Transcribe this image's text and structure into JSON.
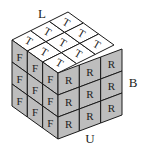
{
  "diagram": {
    "outer_labels": {
      "left_top": "L",
      "right": "B",
      "bottom": "U"
    },
    "faces": {
      "top": {
        "letter": "T",
        "rows": 3,
        "cols": 3,
        "color": "#ffffff"
      },
      "front": {
        "letter": "F",
        "rows": 3,
        "cols": 3,
        "color": "#bdbdbd"
      },
      "right": {
        "letter": "R",
        "rows": 3,
        "cols": 3,
        "color": "#bdbdbd"
      }
    },
    "colors": {
      "edge": "#1a1a1a",
      "shade": "#bdbdbd",
      "top": "#ffffff"
    }
  }
}
